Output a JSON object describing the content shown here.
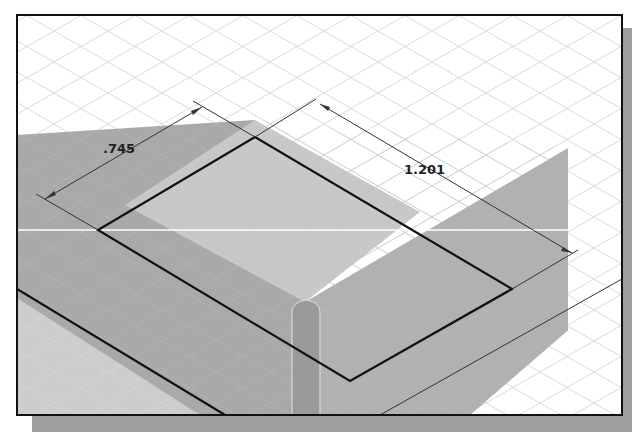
{
  "viewport": {
    "frame": {
      "x": 17,
      "y": 15,
      "width": 605,
      "height": 400
    },
    "shadow_color": "#9a9a9a",
    "background_color": "#ffffff",
    "grid_color": "#c8c8c8"
  },
  "colors": {
    "plane_light": "#c9c9c9",
    "plane_mid": "#b4b4b4",
    "plane_dark": "#a3a3a3",
    "plane_lower": "#d4d4d4",
    "sketch_line": "#111111",
    "dimension_line": "#333333",
    "highlight_bar": "#9b9b9b",
    "cursor_line": "#ffffff"
  },
  "sketch": {
    "rectangle": {
      "top": [
        255,
        137
      ],
      "left": [
        98,
        230
      ],
      "bottom": [
        350,
        381
      ],
      "right": [
        512,
        289
      ]
    }
  },
  "dimensions": [
    {
      "id": "width",
      "label": ".745",
      "text_x": 103,
      "text_y": 153,
      "rotate": 0
    },
    {
      "id": "length",
      "label": "1.201",
      "text_x": 404,
      "text_y": 174,
      "rotate": 0
    }
  ]
}
